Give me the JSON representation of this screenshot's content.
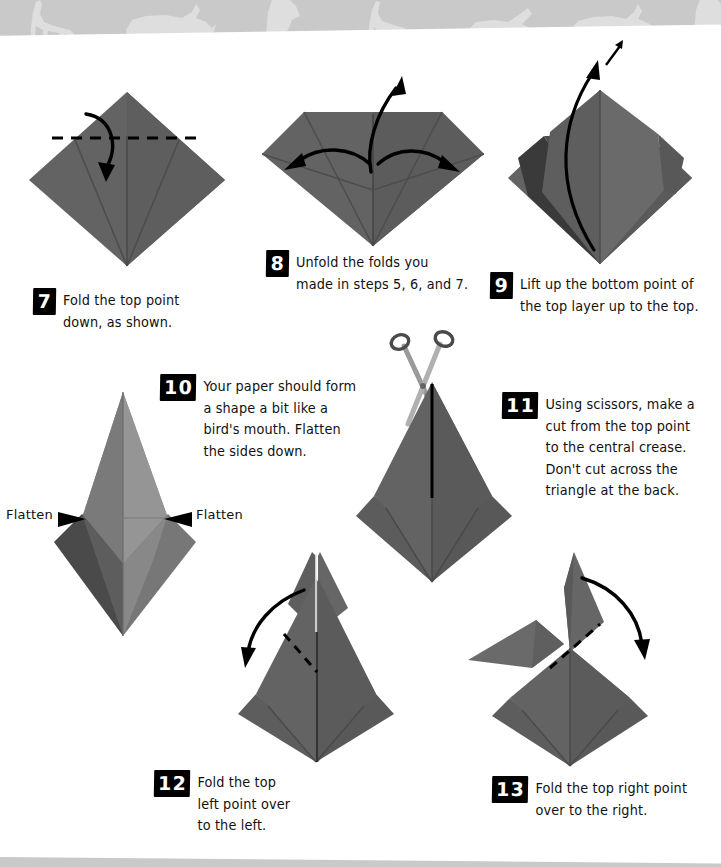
{
  "page": {
    "background_color": "#ffffff",
    "banner_color": "#c9c9c9",
    "paper_color": "#636363",
    "paper_color_light": "#8e8e8e",
    "paper_color_dark": "#4a4a4a",
    "paper_color_darkest": "#2f2f2f",
    "ink_color": "#000000"
  },
  "banner": {
    "name": "animal-silhouette-band",
    "animals": [
      "giraffe",
      "rhino",
      "bird",
      "giraffe",
      "wolf",
      "rhino",
      "bird"
    ]
  },
  "steps": [
    {
      "number": "7",
      "text": "Fold the top point\ndown, as shown.",
      "diagram": "diamond-with-top-fold"
    },
    {
      "number": "8",
      "text": "Unfold the folds you\nmade in steps 5, 6, and 7.",
      "diagram": "wide-diamond-three-arrows"
    },
    {
      "number": "9",
      "text": "Lift up the bottom point of\nthe top layer up to the top.",
      "diagram": "layered-diamond-lift-arrow"
    },
    {
      "number": "10",
      "text": "Your paper should form\na shape a bit like a\nbird's mouth. Flatten\nthe sides down.",
      "diagram": "birds-mouth-shape"
    },
    {
      "number": "11",
      "text": "Using scissors, make a\ncut from the top point\nto the central crease.\nDon't cut across the\ntriangle at the back.",
      "diagram": "kite-with-scissors"
    },
    {
      "number": "12",
      "text": "Fold the top\nleft point over\nto the left.",
      "diagram": "cut-kite-fold-left"
    },
    {
      "number": "13",
      "text": "Fold the top right point\nover to the right.",
      "diagram": "folded-left-fold-right"
    }
  ],
  "annotations": {
    "flatten_left": "Flatten",
    "flatten_right": "Flatten"
  }
}
